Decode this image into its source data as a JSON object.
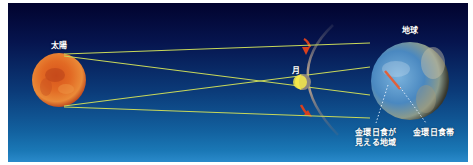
{
  "diagram": {
    "labels": {
      "sun": "太陽",
      "moon": "月",
      "earth": "地球",
      "visible_region_line1": "金環日食が",
      "visible_region_line2": "見える地域",
      "annular_band": "金環日食帯"
    },
    "colors": {
      "background_top": "#02032e",
      "background_bottom": "#2a8acb",
      "sun": "#d9501a",
      "moon_lit": "#f5e94a",
      "orbit": "#9a8a7a",
      "orbit_arrow": "#d8401e",
      "ray_lines": "#c8d85a",
      "earth_ocean": "#4a8ec8",
      "annular_band": "#e0603a"
    }
  }
}
